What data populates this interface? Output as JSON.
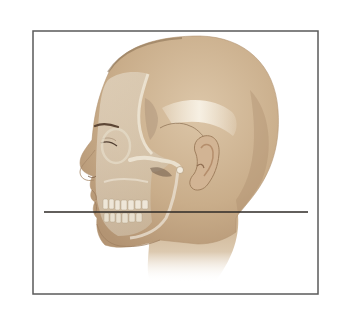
{
  "figure": {
    "view": "left-profile",
    "background": "#ffffff",
    "frame": {
      "x": 33,
      "y": 31,
      "width": 285,
      "height": 263,
      "stroke": "#5a5a5a",
      "stroke_width": 1.5
    },
    "reference_line": {
      "x1": 44,
      "y1": 212,
      "x2": 308,
      "y2": 212,
      "stroke": "#2e2a26",
      "stroke_width": 1.3
    },
    "colors": {
      "skin_light": "#d9c2a3",
      "skin_mid": "#c6a985",
      "skin_dark": "#a88a66",
      "bone": "#e6dccb",
      "bone_shadow": "#b9a88f",
      "bone_highlight": "#f3ece0",
      "suture": "#8b6f52",
      "brow": "#5c4635",
      "ear_inner": "#b58e6c",
      "orbit_shadow": "#9c8a74"
    }
  }
}
